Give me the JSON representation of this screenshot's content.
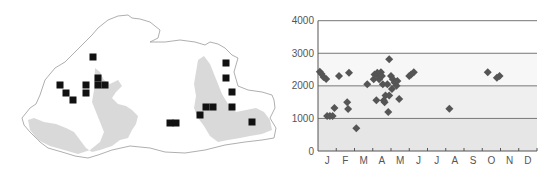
{
  "figure": {
    "left_panel": "distribution map",
    "right_panel": "altitude by month scatter"
  },
  "map": {
    "outline_color": "#9a9a9a",
    "fill_color": "#ffffff",
    "shade_color": "#d9d9d9",
    "marker_color": "#111111",
    "markers": [
      [
        93,
        57
      ],
      [
        60,
        85
      ],
      [
        66,
        93
      ],
      [
        73,
        100
      ],
      [
        86,
        85
      ],
      [
        86,
        93
      ],
      [
        98,
        78
      ],
      [
        98,
        85
      ],
      [
        105,
        85
      ],
      [
        170,
        123
      ],
      [
        176,
        123
      ],
      [
        200,
        115
      ],
      [
        206,
        107
      ],
      [
        213,
        107
      ],
      [
        226,
        63
      ],
      [
        226,
        78
      ],
      [
        232,
        92
      ],
      [
        232,
        107
      ],
      [
        252,
        122
      ]
    ]
  },
  "chart_data": {
    "type": "scatter",
    "title": "",
    "xlabel": "",
    "ylabel": "",
    "categories": [
      "J",
      "F",
      "M",
      "A",
      "M",
      "J",
      "J",
      "A",
      "S",
      "O",
      "N",
      "D"
    ],
    "yticks": [
      0,
      1000,
      2000,
      3000,
      4000
    ],
    "ylim": [
      0,
      4000
    ],
    "grid": true,
    "legend": null,
    "bands": [
      {
        "from": 0,
        "to": 1000,
        "color": "#e6e6e6"
      },
      {
        "from": 1000,
        "to": 2000,
        "color": "#efefef"
      },
      {
        "from": 2000,
        "to": 3000,
        "color": "#f7f7f7"
      },
      {
        "from": 3000,
        "to": 4000,
        "color": "#ffffff"
      }
    ],
    "marker_color": "#555555",
    "points": [
      {
        "month": 0.1,
        "value": 2430
      },
      {
        "month": 0.2,
        "value": 2360
      },
      {
        "month": 0.3,
        "value": 2270
      },
      {
        "month": 0.45,
        "value": 2210
      },
      {
        "month": 0.5,
        "value": 1075
      },
      {
        "month": 0.65,
        "value": 1075
      },
      {
        "month": 0.8,
        "value": 1075
      },
      {
        "month": 0.9,
        "value": 1320
      },
      {
        "month": 1.15,
        "value": 2300
      },
      {
        "month": 1.7,
        "value": 2400
      },
      {
        "month": 1.6,
        "value": 1500
      },
      {
        "month": 1.65,
        "value": 1290
      },
      {
        "month": 2.1,
        "value": 700
      },
      {
        "month": 2.7,
        "value": 2050
      },
      {
        "month": 3.05,
        "value": 2200
      },
      {
        "month": 3.1,
        "value": 2350
      },
      {
        "month": 3.2,
        "value": 1560
      },
      {
        "month": 3.25,
        "value": 2400
      },
      {
        "month": 3.3,
        "value": 2300
      },
      {
        "month": 3.35,
        "value": 2200
      },
      {
        "month": 3.45,
        "value": 2420
      },
      {
        "month": 3.5,
        "value": 2300
      },
      {
        "month": 3.55,
        "value": 2050
      },
      {
        "month": 3.6,
        "value": 1550
      },
      {
        "month": 3.65,
        "value": 1500
      },
      {
        "month": 3.7,
        "value": 1700
      },
      {
        "month": 3.8,
        "value": 2050
      },
      {
        "month": 3.85,
        "value": 1200
      },
      {
        "month": 3.9,
        "value": 2820
      },
      {
        "month": 3.9,
        "value": 1700
      },
      {
        "month": 4.0,
        "value": 2300
      },
      {
        "month": 4.05,
        "value": 1900
      },
      {
        "month": 4.1,
        "value": 2200
      },
      {
        "month": 4.2,
        "value": 2100
      },
      {
        "month": 4.3,
        "value": 2000
      },
      {
        "month": 4.35,
        "value": 2150
      },
      {
        "month": 4.45,
        "value": 1600
      },
      {
        "month": 5.0,
        "value": 2300
      },
      {
        "month": 5.1,
        "value": 2350
      },
      {
        "month": 5.25,
        "value": 2420
      },
      {
        "month": 7.2,
        "value": 1300
      },
      {
        "month": 9.3,
        "value": 2420
      },
      {
        "month": 9.8,
        "value": 2250
      },
      {
        "month": 9.95,
        "value": 2300
      }
    ]
  }
}
